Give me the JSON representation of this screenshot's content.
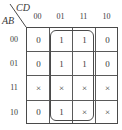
{
  "kmap": {
    "row_var": "AB",
    "col_var": "CD",
    "col_labels": [
      "00",
      "01",
      "11",
      "10"
    ],
    "row_labels": [
      "00",
      "01",
      "11",
      "10"
    ],
    "cells": [
      [
        "0",
        "1",
        "1",
        "0"
      ],
      [
        "0",
        "1",
        "1",
        "0"
      ],
      [
        "×",
        "×",
        "×",
        "×"
      ],
      [
        "0",
        "1",
        "×",
        "×"
      ]
    ],
    "groups": [
      {
        "columns": [
          "01",
          "11"
        ],
        "rows": [
          "00",
          "01",
          "11",
          "10"
        ]
      }
    ]
  }
}
